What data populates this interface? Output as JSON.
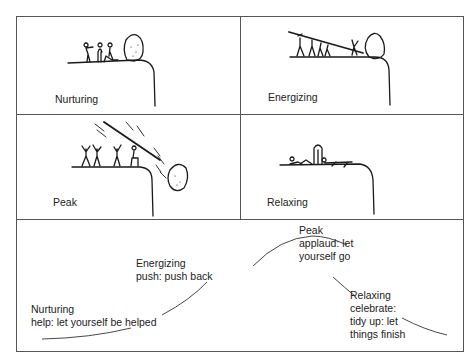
{
  "diagram": {
    "panels": [
      {
        "id": "nurturing",
        "label": "Nurturing",
        "scene": "group-at-cliff-edge-beside-boulder"
      },
      {
        "id": "energizing",
        "label": "Energizing",
        "scene": "group-pushing-boulder-with-pole"
      },
      {
        "id": "peak",
        "label": "Peak",
        "scene": "group-cheering-as-boulder-falls-off-cliff"
      },
      {
        "id": "relaxing",
        "label": "Relaxing",
        "scene": "group-resting-at-cliff-edge"
      }
    ],
    "curve_panel": {
      "stages": [
        {
          "id": "nurturing",
          "lines": [
            "Nurturing",
            "help: let yourself be helped"
          ]
        },
        {
          "id": "energizing",
          "lines": [
            "Energizing",
            "push: push back"
          ]
        },
        {
          "id": "peak",
          "lines": [
            "Peak",
            "applaud: let",
            "yourself go"
          ]
        },
        {
          "id": "relaxing",
          "lines": [
            "Relaxing",
            "celebrate:",
            "tidy up: let",
            "things finish"
          ]
        }
      ]
    }
  }
}
